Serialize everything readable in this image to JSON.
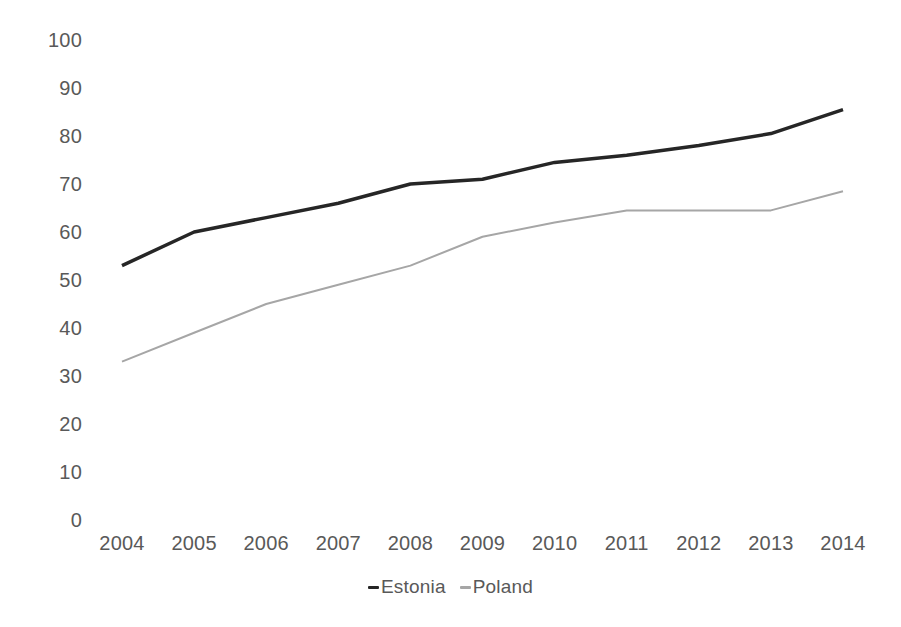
{
  "chart_data": {
    "type": "line",
    "title": "",
    "subtitle": "",
    "xlabel": "",
    "ylabel": "",
    "categories": [
      "2004",
      "2005",
      "2006",
      "2007",
      "2008",
      "2009",
      "2010",
      "2011",
      "2012",
      "2013",
      "2014"
    ],
    "x": [
      2004,
      2005,
      2006,
      2007,
      2008,
      2009,
      2010,
      2011,
      2012,
      2013,
      2014
    ],
    "series": [
      {
        "name": "Estonia",
        "color": "#262626",
        "line_width": 3.5,
        "values": [
          53,
          60,
          63,
          66,
          70,
          71,
          74.5,
          76,
          78,
          80.5,
          85.5
        ]
      },
      {
        "name": "Poland",
        "color": "#a6a6a6",
        "line_width": 2,
        "values": [
          33,
          39,
          45,
          49,
          53,
          59,
          62,
          64.5,
          64.5,
          64.5,
          68.5
        ]
      }
    ],
    "ylim": [
      0,
      100
    ],
    "ytick_values": [
      0,
      10,
      20,
      30,
      40,
      50,
      60,
      70,
      80,
      90,
      100
    ],
    "ytick_labels": [
      "0",
      "10",
      "20",
      "30",
      "40",
      "50",
      "60",
      "70",
      "80",
      "90",
      "100"
    ],
    "xtick_labels": [
      "2004",
      "2005",
      "2006",
      "2007",
      "2008",
      "2009",
      "2010",
      "2011",
      "2012",
      "2013",
      "2014"
    ],
    "grid": false,
    "axis_lines": false,
    "legend_position": "bottom",
    "legend_entries": [
      {
        "label": "Estonia",
        "marker": "dash",
        "color": "#262626"
      },
      {
        "label": "Poland",
        "marker": "dash",
        "color": "#a6a6a6"
      }
    ],
    "annotations": []
  },
  "layout": {
    "plot_left_px": 122,
    "plot_right_px": 843,
    "plot_top_px": 40,
    "plot_bottom_px": 520,
    "label_color": "#595959",
    "background": "#ffffff"
  }
}
